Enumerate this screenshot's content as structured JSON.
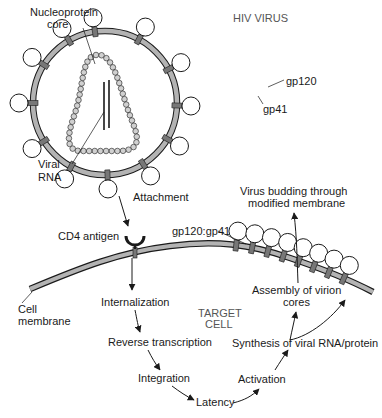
{
  "diagram": {
    "title": "HIV VIRUS",
    "colors": {
      "membrane": "#aaaaaa",
      "outline": "#1a1a1a",
      "protein": "#888888",
      "bead": "#cfcfcf",
      "background": "#ffffff"
    },
    "virus_labels": {
      "nucleoprotein_line1": "Nucleoprotein",
      "nucleoprotein_line2": "core",
      "gp120": "gp120",
      "gp41": "gp41",
      "viral_rna_line1": "Viral",
      "viral_rna_line2": "RNA"
    },
    "cell_labels": {
      "attachment": "Attachment",
      "cd4_antigen": "CD4 antigen",
      "gp120_gp41": "gp120:gp41",
      "cell_membrane_line1": "Cell",
      "cell_membrane_line2": "membrane",
      "target_cell_line1": "TARGET",
      "target_cell_line2": "CELL",
      "budding_line1": "Virus budding through",
      "budding_line2": "modified membrane",
      "assembly_line1": "Assembly of virion",
      "assembly_line2": "cores"
    },
    "lifecycle_steps": [
      "Internalization",
      "Reverse transcription",
      "Integration",
      "Latency",
      "Activation",
      "Synthesis of viral RNA/protein"
    ]
  }
}
